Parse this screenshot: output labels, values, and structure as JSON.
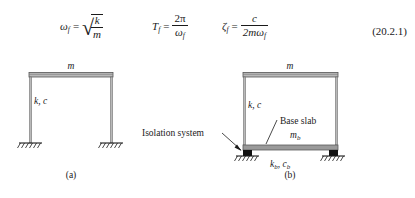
{
  "equations": {
    "eq1": {
      "lhs_var": "ω",
      "lhs_sub": "f",
      "equals": "=",
      "radicand_num": "k",
      "radicand_den": "m",
      "radical_glyph": "√",
      "plain": "ω_f = sqrt(k/m)"
    },
    "eq2": {
      "lhs_var": "T",
      "lhs_sub": "f",
      "equals": "=",
      "num": "2π",
      "den_var": "ω",
      "den_sub": "f",
      "plain": "T_f = 2π/ω_f"
    },
    "eq3": {
      "lhs_var": "ζ",
      "lhs_sub": "f",
      "equals": "=",
      "num": "c",
      "den_prefix": "2m",
      "den_var": "ω",
      "den_sub": "f",
      "plain": "ζ_f = c/(2mω_f)"
    },
    "number": "(20.2.1)"
  },
  "figure": {
    "panel_a": {
      "caption": "(a)",
      "mass_label": "m",
      "stiffness_label": "k, c"
    },
    "panel_b": {
      "caption": "(b)",
      "mass_label": "m",
      "stiffness_label": "k, c",
      "base_slab_label_line1": "Base slab",
      "base_slab_label_line2_var": "m",
      "base_slab_label_line2_sub": "b",
      "isolation_callout": "Isolation system",
      "isolator_stiffness_var1": "k",
      "isolator_stiffness_sub1": "b",
      "isolator_stiffness_sep": ", ",
      "isolator_stiffness_var2": "c",
      "isolator_stiffness_sub2": "b"
    }
  },
  "colors": {
    "ink": "#1a1a1a",
    "member_fill": "#b8b8b8",
    "member_stroke": "#4a4a4a",
    "slab_fill": "#9a9a9a",
    "bearing_fill": "#111111"
  }
}
